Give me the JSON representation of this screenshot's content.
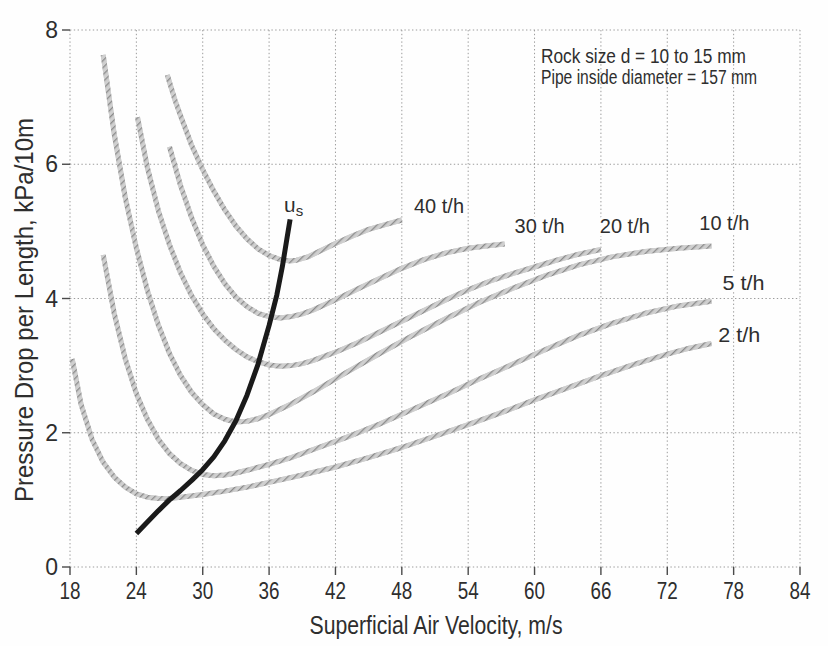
{
  "chart_data": {
    "type": "line",
    "title": "",
    "xlabel": "Superficial Air Velocity, m/s",
    "ylabel": "Pressure Drop per Length, kPa/10m",
    "xlim": [
      18,
      84
    ],
    "ylim": [
      0,
      8
    ],
    "x_ticks": [
      18,
      24,
      30,
      36,
      42,
      48,
      54,
      60,
      66,
      72,
      78,
      84
    ],
    "y_ticks": [
      0,
      2,
      4,
      6,
      8
    ],
    "grid": "dotted",
    "legend_position": "inline-labels",
    "annotations": [
      "Rock size d = 10 to 15 mm",
      "Pipe inside diameter = 157 mm"
    ],
    "series": [
      {
        "name": "2th",
        "label": "2 t/h",
        "style": "hatched-gray",
        "label_pos": [
          76.6,
          3.36
        ],
        "points": [
          [
            18.2,
            3.1
          ],
          [
            19,
            2.42
          ],
          [
            20,
            1.9
          ],
          [
            21,
            1.56
          ],
          [
            22,
            1.34
          ],
          [
            23,
            1.19
          ],
          [
            24,
            1.09
          ],
          [
            25,
            1.04
          ],
          [
            26,
            1.02
          ],
          [
            27,
            1.02
          ],
          [
            28,
            1.04
          ],
          [
            30,
            1.08
          ],
          [
            32,
            1.13
          ],
          [
            34,
            1.19
          ],
          [
            36,
            1.26
          ],
          [
            39,
            1.37
          ],
          [
            42,
            1.49
          ],
          [
            45,
            1.63
          ],
          [
            48,
            1.78
          ],
          [
            51,
            1.95
          ],
          [
            54,
            2.12
          ],
          [
            57,
            2.3
          ],
          [
            60,
            2.49
          ],
          [
            63,
            2.67
          ],
          [
            66,
            2.85
          ],
          [
            69,
            3.02
          ],
          [
            72,
            3.17
          ],
          [
            74,
            3.26
          ],
          [
            76,
            3.33
          ]
        ]
      },
      {
        "name": "5th",
        "label": "5 t/h",
        "style": "hatched-gray",
        "label_pos": [
          77.0,
          4.12
        ],
        "points": [
          [
            21,
            4.65
          ],
          [
            22,
            3.78
          ],
          [
            23,
            3.1
          ],
          [
            24,
            2.58
          ],
          [
            25,
            2.2
          ],
          [
            26,
            1.9
          ],
          [
            27,
            1.69
          ],
          [
            28,
            1.54
          ],
          [
            29,
            1.44
          ],
          [
            30,
            1.38
          ],
          [
            31,
            1.36
          ],
          [
            32,
            1.37
          ],
          [
            33,
            1.4
          ],
          [
            34,
            1.44
          ],
          [
            36,
            1.53
          ],
          [
            38,
            1.63
          ],
          [
            40,
            1.75
          ],
          [
            43,
            1.93
          ],
          [
            46,
            2.13
          ],
          [
            49,
            2.35
          ],
          [
            52,
            2.57
          ],
          [
            55,
            2.8
          ],
          [
            58,
            3.02
          ],
          [
            61,
            3.24
          ],
          [
            64,
            3.45
          ],
          [
            67,
            3.63
          ],
          [
            70,
            3.78
          ],
          [
            73,
            3.89
          ],
          [
            76,
            3.96
          ]
        ]
      },
      {
        "name": "10th",
        "label": "10 t/h",
        "style": "hatched-gray",
        "label_pos": [
          74.9,
          5.02
        ],
        "points": [
          [
            21,
            7.63
          ],
          [
            22,
            6.45
          ],
          [
            23,
            5.5
          ],
          [
            24,
            4.75
          ],
          [
            25,
            4.12
          ],
          [
            26,
            3.6
          ],
          [
            27,
            3.18
          ],
          [
            28,
            2.85
          ],
          [
            29,
            2.6
          ],
          [
            30,
            2.42
          ],
          [
            31,
            2.28
          ],
          [
            32,
            2.2
          ],
          [
            33,
            2.16
          ],
          [
            34,
            2.17
          ],
          [
            35,
            2.21
          ],
          [
            36,
            2.27
          ],
          [
            38,
            2.43
          ],
          [
            40,
            2.61
          ],
          [
            43,
            2.9
          ],
          [
            46,
            3.18
          ],
          [
            49,
            3.45
          ],
          [
            52,
            3.7
          ],
          [
            55,
            3.94
          ],
          [
            58,
            4.15
          ],
          [
            61,
            4.34
          ],
          [
            64,
            4.5
          ],
          [
            67,
            4.62
          ],
          [
            70,
            4.7
          ],
          [
            73,
            4.75
          ],
          [
            76,
            4.78
          ]
        ]
      },
      {
        "name": "20th",
        "label": "20 t/h",
        "style": "hatched-gray",
        "label_pos": [
          65.9,
          4.98
        ],
        "points": [
          [
            24.1,
            6.7
          ],
          [
            25,
            5.95
          ],
          [
            26,
            5.3
          ],
          [
            27,
            4.8
          ],
          [
            28,
            4.38
          ],
          [
            29,
            4.04
          ],
          [
            30,
            3.77
          ],
          [
            31,
            3.55
          ],
          [
            32,
            3.38
          ],
          [
            33,
            3.24
          ],
          [
            34,
            3.13
          ],
          [
            35,
            3.06
          ],
          [
            36,
            3.01
          ],
          [
            37,
            2.99
          ],
          [
            38,
            3.0
          ],
          [
            39,
            3.03
          ],
          [
            40,
            3.08
          ],
          [
            42,
            3.2
          ],
          [
            44,
            3.34
          ],
          [
            46,
            3.5
          ],
          [
            48,
            3.66
          ],
          [
            50,
            3.82
          ],
          [
            52,
            3.98
          ],
          [
            54,
            4.13
          ],
          [
            56,
            4.26
          ],
          [
            58,
            4.37
          ],
          [
            60,
            4.47
          ],
          [
            62,
            4.57
          ],
          [
            64,
            4.66
          ],
          [
            66,
            4.73
          ]
        ]
      },
      {
        "name": "30th",
        "label": "30 t/h",
        "style": "hatched-gray",
        "label_pos": [
          58.2,
          4.98
        ],
        "points": [
          [
            27,
            6.26
          ],
          [
            28,
            5.68
          ],
          [
            29,
            5.2
          ],
          [
            30,
            4.8
          ],
          [
            31,
            4.48
          ],
          [
            32,
            4.22
          ],
          [
            33,
            4.02
          ],
          [
            34,
            3.88
          ],
          [
            35,
            3.78
          ],
          [
            36,
            3.73
          ],
          [
            37,
            3.71
          ],
          [
            38,
            3.73
          ],
          [
            39,
            3.77
          ],
          [
            40,
            3.83
          ],
          [
            42,
            3.98
          ],
          [
            44,
            4.14
          ],
          [
            46,
            4.3
          ],
          [
            48,
            4.45
          ],
          [
            50,
            4.58
          ],
          [
            52,
            4.68
          ],
          [
            54,
            4.75
          ],
          [
            56,
            4.79
          ],
          [
            57.3,
            4.81
          ]
        ]
      },
      {
        "name": "40th",
        "label": "40 t/h",
        "style": "hatched-gray",
        "label_pos": [
          49.1,
          5.28
        ],
        "points": [
          [
            26.8,
            7.33
          ],
          [
            27.5,
            6.95
          ],
          [
            28,
            6.72
          ],
          [
            29,
            6.28
          ],
          [
            30,
            5.92
          ],
          [
            31,
            5.6
          ],
          [
            32,
            5.32
          ],
          [
            33,
            5.08
          ],
          [
            34,
            4.89
          ],
          [
            35,
            4.74
          ],
          [
            36,
            4.64
          ],
          [
            37,
            4.58
          ],
          [
            37.8,
            4.56
          ],
          [
            38.5,
            4.57
          ],
          [
            39.5,
            4.62
          ],
          [
            40.5,
            4.7
          ],
          [
            42,
            4.82
          ],
          [
            43.5,
            4.93
          ],
          [
            45,
            5.03
          ],
          [
            46.5,
            5.1
          ],
          [
            48,
            5.17
          ]
        ]
      },
      {
        "name": "us",
        "label": "us",
        "style": "solid-black",
        "points": [
          [
            24,
            0.5
          ],
          [
            25,
            0.67
          ],
          [
            26,
            0.84
          ],
          [
            27,
            1.0
          ],
          [
            28,
            1.14
          ],
          [
            29,
            1.29
          ],
          [
            30,
            1.45
          ],
          [
            31,
            1.64
          ],
          [
            32,
            1.88
          ],
          [
            33,
            2.18
          ],
          [
            34,
            2.56
          ],
          [
            35,
            3.02
          ],
          [
            36,
            3.6
          ],
          [
            36.7,
            4.05
          ],
          [
            37.2,
            4.48
          ],
          [
            37.6,
            4.88
          ],
          [
            37.9,
            5.18
          ]
        ]
      }
    ]
  },
  "us_label": {
    "base": "u",
    "sub": "s"
  },
  "colors": {
    "grid": "#9c9c9c",
    "tick": "#4a4a4a",
    "text": "#2e2e2e",
    "curve_gray_base": "#cfcfcf",
    "curve_gray_hatch": "#8b8b8b",
    "curve_black": "#1a1a1a",
    "background": "#fefefe"
  }
}
